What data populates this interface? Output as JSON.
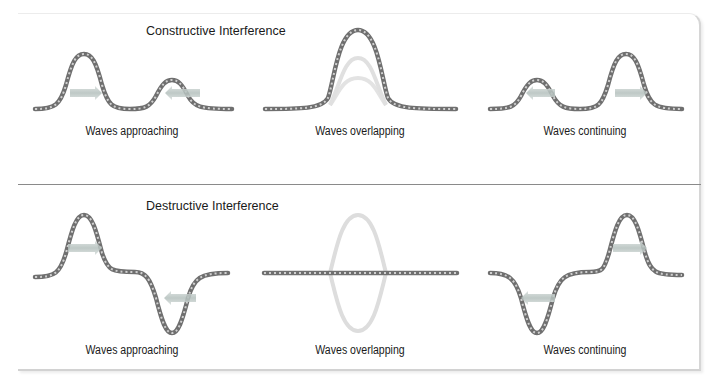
{
  "diagram": {
    "sections": [
      {
        "title": "Constructive Interference",
        "captions": [
          "Waves approaching",
          "Waves overlapping",
          "Waves continuing"
        ]
      },
      {
        "title": "Destructive Interference",
        "captions": [
          "Waves approaching",
          "Waves overlapping",
          "Waves continuing"
        ]
      }
    ],
    "colors": {
      "rope": "#7a7a7a",
      "rope_highlight": "#c8c8c8",
      "ghost_rope": "#d9d9d9",
      "arrow": "#b9c3c1",
      "separator": "#8a8a8a"
    }
  }
}
